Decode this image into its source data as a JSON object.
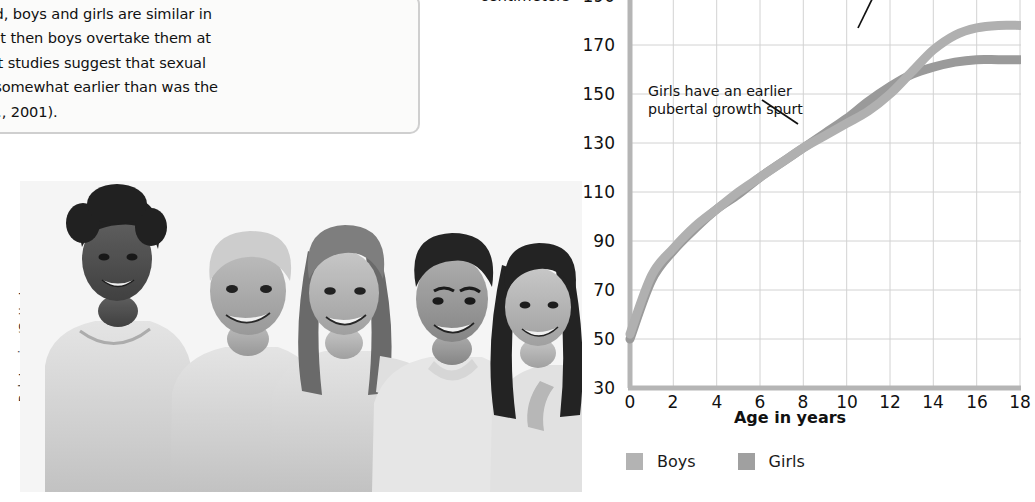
{
  "textbox": {
    "lines": [
      "ughout childhood, boys and girls are similar in",
      "ahead briefly, but then boys overtake them at",
      "er, 1978.) Recent studies suggest that sexual",
      "s are beginning somewhat earlier than was the",
      "an-Giddens et al., 2001)."
    ]
  },
  "photo": {
    "credit": "Rob Lewine/Getty Images",
    "alt": "Five smiling teenagers standing together, black and white photograph"
  },
  "chart_data": {
    "type": "line",
    "title": "",
    "xlabel": "Age in years",
    "ylabel": "centimeters",
    "xlim": [
      0,
      18
    ],
    "ylim": [
      30,
      190
    ],
    "grid": true,
    "legend_position": "bottom-left",
    "xticks": [
      0,
      2,
      4,
      6,
      8,
      10,
      12,
      14,
      16,
      18
    ],
    "yticks": [
      30,
      50,
      70,
      90,
      110,
      130,
      150,
      170,
      190
    ],
    "x": [
      0,
      1,
      2,
      3,
      4,
      5,
      6,
      7,
      8,
      9,
      10,
      11,
      12,
      13,
      14,
      15,
      16,
      17,
      18
    ],
    "series": [
      {
        "name": "Boys",
        "color": "#b0b0b0",
        "values": [
          52,
          76,
          87,
          96,
          103,
          110,
          116,
          122,
          128,
          133,
          138,
          143,
          150,
          159,
          168,
          174,
          177,
          178,
          178
        ]
      },
      {
        "name": "Girls",
        "color": "#9a9a9a",
        "values": [
          50,
          74,
          86,
          95,
          103,
          109,
          116,
          122,
          128,
          134,
          140,
          147,
          153,
          158,
          161,
          163,
          164,
          164,
          164
        ]
      }
    ],
    "annotations": [
      {
        "id": "boys-taller",
        "text": "taller than girls after age 14",
        "truncated_top": true
      },
      {
        "id": "girls-spurt",
        "text": "Girls have an earlier\npubertal growth spurt"
      }
    ]
  },
  "legend": {
    "items": [
      {
        "label": "Boys",
        "color": "#b3b3b3"
      },
      {
        "label": "Girls",
        "color": "#a0a0a0"
      }
    ]
  }
}
